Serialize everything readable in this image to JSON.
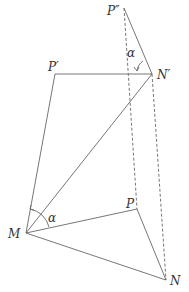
{
  "diagram": {
    "points": {
      "P_double_prime": {
        "label": "P″",
        "x": 124,
        "y": 8
      },
      "P_prime": {
        "label": "P′",
        "x": 55,
        "y": 74
      },
      "N_prime": {
        "label": "N′",
        "x": 152,
        "y": 74
      },
      "M": {
        "label": "M",
        "x": 26,
        "y": 233
      },
      "P": {
        "label": "P",
        "x": 137,
        "y": 209
      },
      "N": {
        "label": "N",
        "x": 166,
        "y": 280
      }
    },
    "angle_labels": {
      "top": "α",
      "bottom": "α"
    },
    "colors": {
      "line": "#666666",
      "text": "#333333"
    }
  }
}
